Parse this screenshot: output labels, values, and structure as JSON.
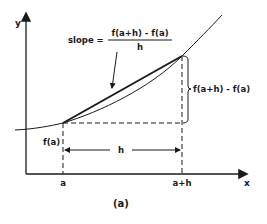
{
  "diagram": {
    "caption": "(a)",
    "axes": {
      "x_label": "x",
      "y_label": "y"
    },
    "slope_label": {
      "prefix": "slope =",
      "numerator": "f(a+h) - f(a)",
      "denominator": "h"
    },
    "rise_label": "f(a+h) - f(a)",
    "fa_label": "f(a)",
    "run_label": "h",
    "tick_labels": {
      "a": "a",
      "a_plus_h": "a+h"
    },
    "colors": {
      "ink": "#1a1a1a",
      "background": "#ffffff"
    }
  }
}
